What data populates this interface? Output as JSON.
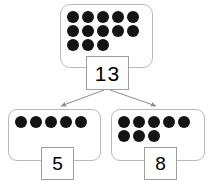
{
  "diagram": {
    "type": "number-bond-part-part-whole",
    "colors": {
      "background": "#ffffff",
      "dot": "#141414",
      "box_border": "#b9b9b9",
      "label_border": "#9e9e9e",
      "arrow": "#8c8c8c",
      "text": "#000000"
    },
    "whole": {
      "label": "13",
      "dot_count": 13,
      "dot_rows": [
        5,
        5,
        3
      ]
    },
    "parts": [
      {
        "label": "5",
        "dot_count": 5,
        "dot_rows": [
          5
        ]
      },
      {
        "label": "8",
        "dot_count": 8,
        "dot_rows": [
          5,
          3
        ]
      }
    ],
    "arrows": [
      {
        "name": "arrow-to-left-part",
        "from": "whole",
        "to": "part-5"
      },
      {
        "name": "arrow-to-right-part",
        "from": "whole",
        "to": "part-8"
      }
    ]
  }
}
